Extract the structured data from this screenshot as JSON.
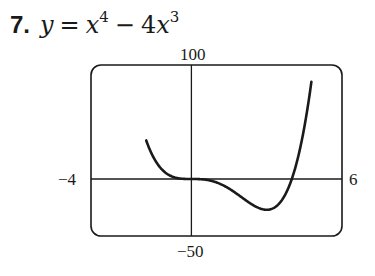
{
  "problem": {
    "number": "7.",
    "equation_parts": {
      "lhs": "y",
      "equals": "=",
      "term1_base": "x",
      "term1_exp": "4",
      "minus": "−",
      "term2_coef": "4",
      "term2_base": "x",
      "term2_exp": "3"
    }
  },
  "chart_data": {
    "type": "line",
    "function": "x^4 - 4*x^3",
    "xlim": [
      -4,
      6
    ],
    "ylim": [
      -50,
      100
    ],
    "grid": false,
    "legend": null,
    "axis_labels": {
      "x_min": "−4",
      "x_max": "6",
      "y_max": "100",
      "y_min": "−50"
    },
    "series": [
      {
        "name": "y = x^4 − 4x^3",
        "x": [
          -1.7,
          -1.5,
          -1.25,
          -1,
          -0.75,
          -0.5,
          -0.25,
          0,
          0.5,
          1,
          1.5,
          2,
          2.5,
          3,
          3.5,
          4,
          4.25,
          4.5,
          4.68
        ],
        "y": [
          42.0,
          18.6,
          10.2,
          5,
          2.0,
          0.56,
          0.07,
          0,
          -0.44,
          -3,
          -8.4,
          -16,
          -23.4,
          -27,
          -21.4,
          0,
          17.6,
          45.6,
          70.0
        ]
      }
    ],
    "key_points": {
      "local_min": [
        3,
        -27
      ],
      "roots": [
        0,
        4
      ],
      "inflection_points": [
        [
          0,
          0
        ],
        [
          2,
          -16
        ]
      ]
    }
  }
}
